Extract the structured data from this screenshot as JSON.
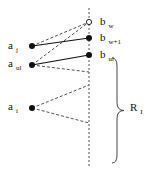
{
  "diagram": {
    "type": "bipartite-matching-sketch",
    "colors": {
      "stroke": "#111111",
      "dashed": "#555555",
      "background": "#ffffff"
    },
    "axis": {
      "x": 89,
      "y1": 8,
      "y2": 168,
      "style": "dashed"
    },
    "left_nodes": [
      {
        "id": "a_j",
        "base": "a",
        "sub": "j",
        "x": 32,
        "y": 46,
        "label_x": 8,
        "label_y": 40
      },
      {
        "id": "a_ul",
        "base": "a",
        "sub": "ul",
        "x": 32,
        "y": 65,
        "label_x": 8,
        "label_y": 58
      },
      {
        "id": "a_i",
        "base": "a",
        "sub": "i",
        "x": 32,
        "y": 108,
        "label_x": 8,
        "label_y": 101
      }
    ],
    "right_nodes": [
      {
        "id": "b_w",
        "base": "b",
        "sub": "w",
        "x": 89,
        "y": 22,
        "filled": false,
        "label_x": 100,
        "label_y": 16
      },
      {
        "id": "b_w+1",
        "base": "b",
        "sub": "w+1",
        "x": 89,
        "y": 38,
        "filled": true,
        "label_x": 100,
        "label_y": 32
      },
      {
        "id": "b_ul",
        "base": "b",
        "sub": "ul",
        "x": 89,
        "y": 55,
        "filled": true,
        "label_x": 100,
        "label_y": 49
      }
    ],
    "solid_edges": [
      {
        "from": "a_j",
        "to": "b_w+1"
      },
      {
        "from": "a_ul",
        "to": "b_ul"
      }
    ],
    "dashed_edges": [
      {
        "from": [
          32,
          46
        ],
        "to": [
          89,
          22
        ]
      },
      {
        "from": [
          32,
          65
        ],
        "to": [
          89,
          22
        ]
      },
      {
        "from": [
          32,
          65
        ],
        "to": [
          89,
          72
        ]
      },
      {
        "from": [
          32,
          108
        ],
        "to": [
          89,
          85
        ]
      },
      {
        "from": [
          32,
          108
        ],
        "to": [
          89,
          123
        ]
      }
    ],
    "brace": {
      "x": 115,
      "y_top": 58,
      "y_bottom": 163,
      "tip_x": 124
    },
    "region_label": {
      "base": "R",
      "sub": "I",
      "x": 130,
      "y": 102
    }
  }
}
